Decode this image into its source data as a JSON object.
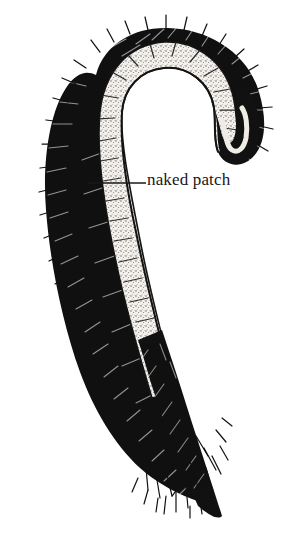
{
  "figure": {
    "name": "tail-illustration",
    "kind": "line-drawing",
    "background_color": "#ffffff",
    "ink_color": "#111111",
    "patch_fill_color": "#f2efe9",
    "patch_stipple_color": "#3a3a3a",
    "width": 296,
    "height": 538
  },
  "annotations": {
    "naked_patch": {
      "label": "naked patch",
      "text_color": "#18171a",
      "font_size_px": 17,
      "leader_line": {
        "x1": 88,
        "y1": 183,
        "x2": 146,
        "y2": 183,
        "color": "#18171a",
        "width_px": 1.6
      }
    }
  },
  "regions": {
    "fur": {
      "name": "fur",
      "color": "#111111"
    },
    "naked_patch_band": {
      "name": "naked-patch-band",
      "color": "#f2efe9"
    },
    "tail_tuft": {
      "name": "tail-tuft",
      "color": "#111111"
    }
  }
}
